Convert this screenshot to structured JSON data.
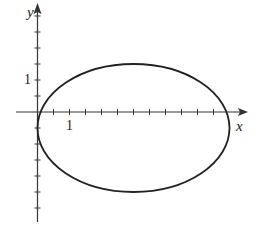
{
  "chart_data": {
    "type": "line",
    "title": "",
    "xlabel": "x",
    "ylabel": "y",
    "curve": {
      "shape": "ellipse",
      "center": [
        3,
        -0.5
      ],
      "semi_axis_x": 3,
      "semi_axis_y": 2,
      "equation": "(x-3)^2/9 + (y+0.5)^2/4 = 1"
    },
    "xlim": [
      -0.25,
      6.5
    ],
    "ylim": [
      -3.4,
      3.4
    ],
    "x_tick_step": 0.5,
    "y_tick_step": 0.5,
    "labeled_ticks": {
      "x": [
        {
          "value": 1,
          "label": "1"
        }
      ],
      "y": [
        {
          "value": 1,
          "label": "1"
        }
      ]
    },
    "grid": false,
    "legend": null
  },
  "labels": {
    "x_axis": "x",
    "y_axis": "y",
    "x_tick_one": "1",
    "y_tick_one": "1"
  },
  "colors": {
    "curve": "#222222",
    "axes": "#333333"
  }
}
